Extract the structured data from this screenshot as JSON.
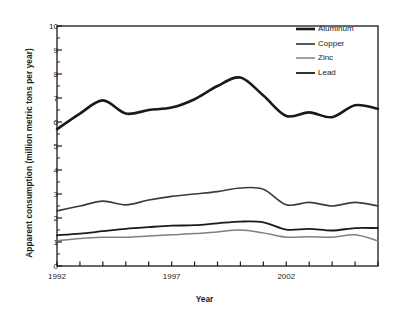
{
  "chart_data": {
    "type": "line",
    "title": "",
    "xlabel": "Year",
    "ylabel": "Apparent consumption (million metric tons per year)",
    "xlim": [
      1992,
      2006
    ],
    "ylim": [
      0,
      10
    ],
    "yticks": [
      0,
      1,
      2,
      3,
      4,
      5,
      6,
      7,
      8,
      9,
      10
    ],
    "ytick_labels": [
      "0",
      "1",
      "2",
      "3",
      "4",
      "5",
      "6",
      "7",
      "8",
      "9",
      "10"
    ],
    "xticks": [
      1992,
      1993,
      1994,
      1995,
      1996,
      1997,
      1998,
      1999,
      2000,
      2001,
      2002,
      2003,
      2004,
      2005,
      2006
    ],
    "xtick_labels": [
      "1992",
      "",
      "",
      "",
      "",
      "1997",
      "",
      "",
      "",
      "",
      "2002",
      "",
      "",
      "",
      ""
    ],
    "grid": false,
    "legend_position": "top-right",
    "x": [
      1992,
      1993,
      1994,
      1995,
      1996,
      1997,
      1998,
      1999,
      2000,
      2001,
      2002,
      2003,
      2004,
      2005,
      2006
    ],
    "series": [
      {
        "name": "Aluminum",
        "color": "#1a1a1a",
        "linewidth": 2.6,
        "values": [
          5.7,
          6.35,
          6.9,
          6.35,
          6.5,
          6.6,
          6.95,
          7.5,
          7.85,
          7.1,
          6.25,
          6.4,
          6.2,
          6.7,
          6.55
        ]
      },
      {
        "name": "Copper",
        "color": "#3c3c3c",
        "linewidth": 1.7,
        "values": [
          2.3,
          2.5,
          2.7,
          2.55,
          2.75,
          2.9,
          3.0,
          3.1,
          3.25,
          3.2,
          2.55,
          2.65,
          2.5,
          2.65,
          2.5
        ]
      },
      {
        "name": "Zinc",
        "color": "#808080",
        "linewidth": 1.5,
        "values": [
          1.05,
          1.15,
          1.2,
          1.2,
          1.25,
          1.3,
          1.35,
          1.42,
          1.5,
          1.38,
          1.2,
          1.22,
          1.2,
          1.3,
          1.05
        ]
      },
      {
        "name": "Lead",
        "color": "#1a1a1a",
        "linewidth": 1.8,
        "values": [
          1.28,
          1.35,
          1.45,
          1.55,
          1.62,
          1.68,
          1.7,
          1.78,
          1.85,
          1.82,
          1.52,
          1.55,
          1.48,
          1.58,
          1.58
        ]
      }
    ]
  },
  "legend": {
    "items": [
      {
        "label": "Aluminum"
      },
      {
        "label": "Copper"
      },
      {
        "label": "Zinc"
      },
      {
        "label": "Lead"
      }
    ]
  }
}
